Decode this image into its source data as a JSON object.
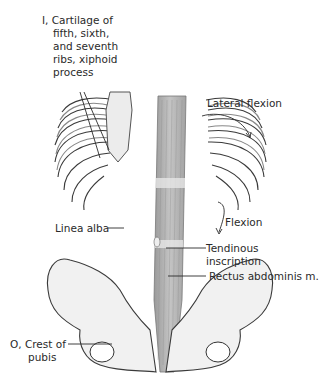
{
  "figure": {
    "labels": {
      "insertion": [
        "I, Cartilage of",
        "fifth, sixth,",
        "and seventh",
        "ribs, xiphoid",
        "process"
      ],
      "lateral_flexion": "Lateral flexion",
      "flexion": "Flexion",
      "linea_alba": "Linea alba",
      "tendinous_inscription": [
        "Tendinous",
        "inscription"
      ],
      "rectus_abdominis": "Rectus abdominis m.",
      "origin": [
        "O, Crest of",
        "pubis"
      ]
    },
    "colors": {
      "line": "#2a2a2a",
      "bone_fill": "#f1f1f1",
      "bone_stroke": "#3a3a3a",
      "muscle": "#b5b5b5",
      "muscle_dark": "#8f8f8f",
      "inscription": "#e6e6e6"
    }
  }
}
